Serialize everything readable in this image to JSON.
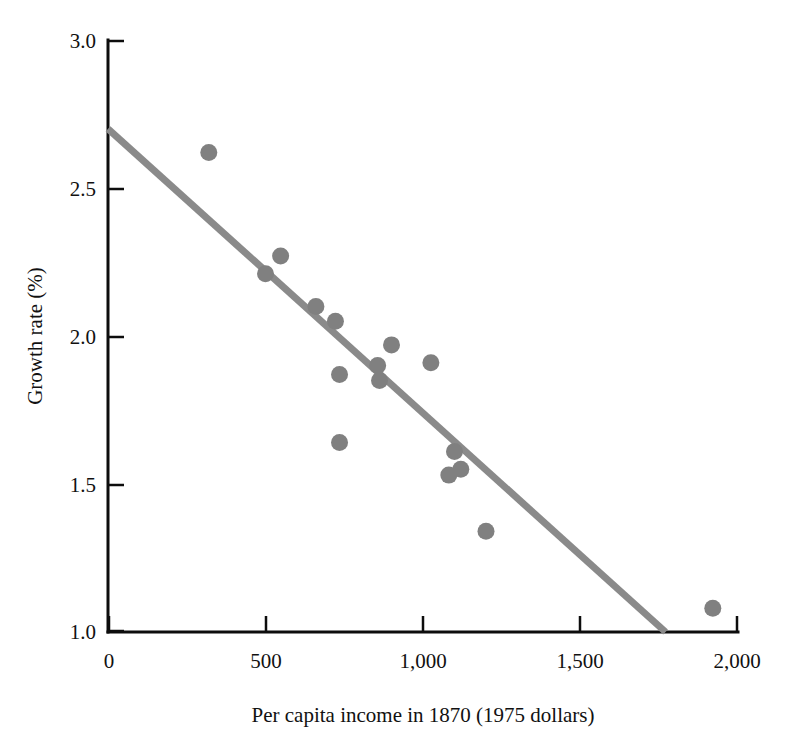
{
  "chart_data": {
    "type": "scatter",
    "title": "",
    "xlabel": "Per capita income in 1870 (1975 dollars)",
    "ylabel": "Growth rate (%)",
    "xlim": [
      0,
      2000
    ],
    "ylim": [
      1.0,
      3.0
    ],
    "grid": false,
    "legend": null,
    "marker_color": "#808080",
    "line_color": "#8a8a8a",
    "axis_color": "#0d0d0d",
    "xticks": [
      0,
      500,
      1000,
      1500,
      2000
    ],
    "xtick_labels": [
      "0",
      "500",
      "1,000",
      "1,500",
      "2,000"
    ],
    "yticks": [
      1.0,
      1.5,
      2.0,
      2.5,
      3.0
    ],
    "ytick_labels": [
      "1.0",
      "1.5",
      "2.0",
      "2.5",
      "3.0"
    ],
    "points": [
      {
        "x": 320,
        "y": 2.62
      },
      {
        "x": 500,
        "y": 2.21
      },
      {
        "x": 548,
        "y": 2.27
      },
      {
        "x": 660,
        "y": 2.1
      },
      {
        "x": 722,
        "y": 2.05
      },
      {
        "x": 735,
        "y": 1.87
      },
      {
        "x": 735,
        "y": 1.64
      },
      {
        "x": 856,
        "y": 1.9
      },
      {
        "x": 862,
        "y": 1.85
      },
      {
        "x": 900,
        "y": 1.97
      },
      {
        "x": 1025,
        "y": 1.91
      },
      {
        "x": 1100,
        "y": 1.61
      },
      {
        "x": 1120,
        "y": 1.55
      },
      {
        "x": 1082,
        "y": 1.53
      },
      {
        "x": 1200,
        "y": 1.34
      },
      {
        "x": 1920,
        "y": 1.08
      }
    ],
    "fit_line": {
      "name": "regression-line",
      "x_start": 0,
      "y_start": 2.7,
      "x_end": 1770,
      "y_end": 1.0
    }
  },
  "annotations": {
    "x_axis_name": "x-axis",
    "y_axis_name": "y-axis"
  }
}
